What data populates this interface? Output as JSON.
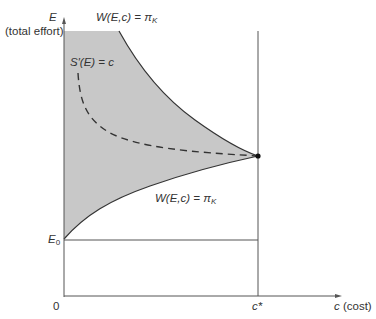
{
  "diagram": {
    "y_axis": {
      "symbol": "E",
      "label": "(total effort)"
    },
    "x_axis": {
      "symbol": "c",
      "label": "(cost)"
    },
    "origin_label": "0",
    "e0_label": {
      "base": "E",
      "sub": "0"
    },
    "cstar_label": "c*",
    "upper_curve_label": {
      "lhs": "W(E,c) = π",
      "sub": "K"
    },
    "lower_curve_label": {
      "lhs": "W(E,c) = π",
      "sub": "K"
    },
    "dashed_curve_label": "S′(E) = c",
    "colors": {
      "shading": "#c8c8c8",
      "line": "#333333",
      "background": "#ffffff"
    }
  }
}
